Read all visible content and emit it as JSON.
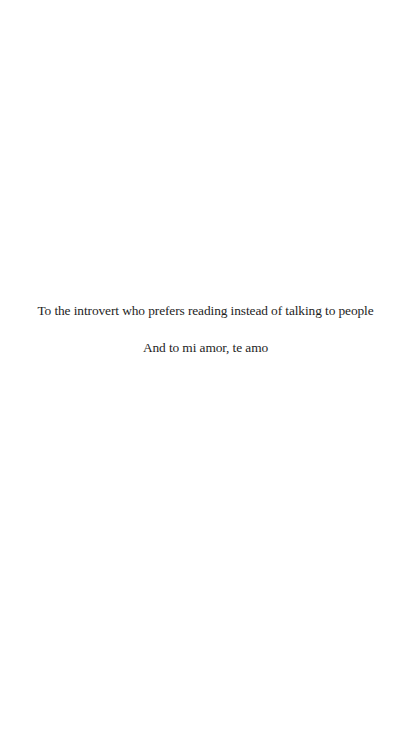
{
  "page": {
    "type": "dedication",
    "background_color": "#ffffff",
    "text_color": "#1e1e1e"
  },
  "dedication": {
    "lines": [
      "To the introvert who prefers reading instead of talking to people",
      "And to mi amor, te amo"
    ]
  }
}
